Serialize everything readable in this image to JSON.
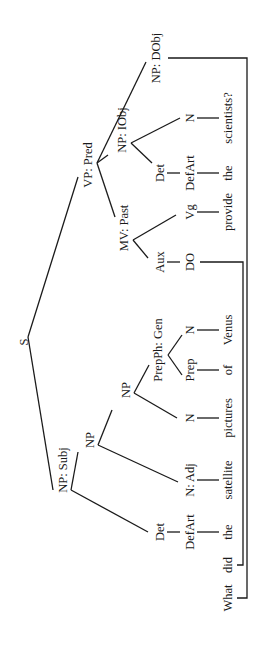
{
  "diagram": {
    "type": "syntax-tree",
    "orientation": "rotated-90-ccw",
    "sentence": "What did the satellite pictures of Venus provide the scientists?",
    "root": "S",
    "nodes": {
      "s": "S",
      "np_subj": "NP: Subj",
      "vp_pred": "VP: Pred",
      "np1": "NP",
      "np2": "NP",
      "det1": "Det",
      "defart1": "DefArt",
      "n_adj": "N: Adj",
      "n_pictures": "N",
      "prepph_gen": "PrepPh: Gen",
      "prep": "Prep",
      "n_venus": "N",
      "mv_past": "MV: Past",
      "aux": "Aux",
      "do": "DO",
      "vg": "Vg",
      "np_iobj": "NP: IObj",
      "det2": "Det",
      "defart2": "DefArt",
      "n_scientists": "N",
      "np_dobj": "NP: DObj"
    },
    "words": [
      "What",
      "did",
      "the",
      "satellite",
      "pictures",
      "of",
      "Venus",
      "provide",
      "the",
      "scientists?"
    ]
  }
}
